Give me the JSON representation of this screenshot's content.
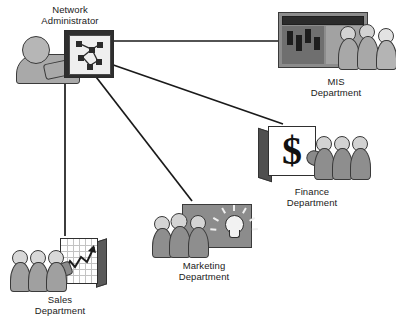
{
  "diagram": {
    "background_color": "#ffffff",
    "line_color": "#1a1a1a",
    "nodes": [
      {
        "id": "admin",
        "label": "Network\nAdministrator",
        "label_position": "above",
        "icon": "person-at-network-screen-icon"
      },
      {
        "id": "mis",
        "label": "MIS\nDepartment",
        "label_position": "below",
        "icon": "server-board-with-people-icon"
      },
      {
        "id": "finance",
        "label": "Finance\nDepartment",
        "label_position": "below",
        "icon": "dollar-whiteboard-with-people-icon",
        "symbol": "$"
      },
      {
        "id": "marketing",
        "label": "Marketing\nDepartment",
        "label_position": "below",
        "icon": "lightbulb-board-with-people-icon"
      },
      {
        "id": "sales",
        "label": "Sales\nDepartment",
        "label_position": "below",
        "icon": "growth-chart-with-people-icon"
      }
    ],
    "connections": [
      {
        "from": "admin",
        "to": "mis"
      },
      {
        "from": "admin",
        "to": "finance"
      },
      {
        "from": "admin",
        "to": "marketing"
      },
      {
        "from": "admin",
        "to": "sales"
      }
    ]
  }
}
